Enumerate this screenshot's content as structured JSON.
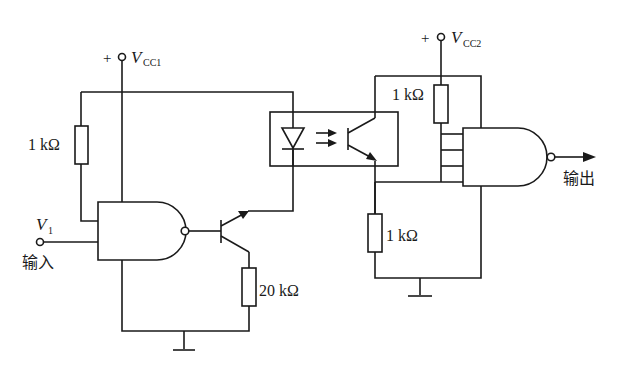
{
  "diagram": {
    "supplies": {
      "vcc1": {
        "sign": "+",
        "label": "V",
        "sub": "CC1"
      },
      "vcc2": {
        "sign": "+",
        "label": "V",
        "sub": "CC2"
      }
    },
    "resistors": {
      "r_input_pullup": "1 kΩ",
      "r_emitter": "20 kΩ",
      "r_output_pullup": "1 kΩ",
      "r_output_pulldown": "1 kΩ"
    },
    "input": {
      "label": "V",
      "sub": "1",
      "caption": "输入"
    },
    "output": {
      "caption": "输出"
    },
    "components": [
      "NAND gate (input side)",
      "NPN transistor",
      "optocoupler (LED + phototransistor)",
      "NAND gate (output side, 4 inputs)",
      "ground symbols"
    ]
  }
}
